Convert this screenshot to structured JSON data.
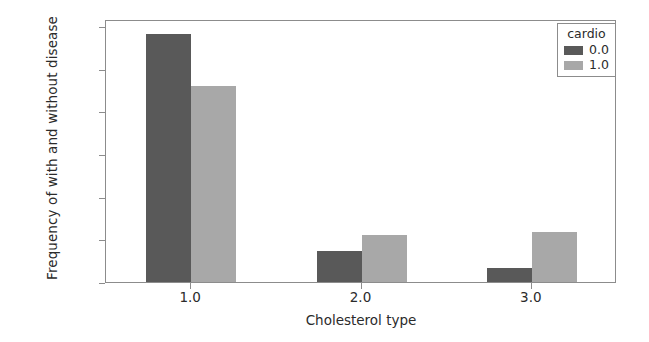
{
  "chart_data": {
    "type": "bar",
    "title": "",
    "subtitle": "",
    "xlabel": "Cholesterol type",
    "ylabel": "Frequency of with and without disease",
    "categories": [
      "1.0",
      "2.0",
      "3.0"
    ],
    "series": [
      {
        "name": "0.0",
        "color": "#595959",
        "values": [
          29100,
          3600,
          1600
        ]
      },
      {
        "name": "1.0",
        "color": "#a8a8a8",
        "values": [
          23000,
          5550,
          5850
        ]
      }
    ],
    "ylim": [
      0,
      30800
    ],
    "yticks": [
      0,
      5000,
      10000,
      15000,
      20000,
      25000,
      30000
    ],
    "ytick_labels": [
      "0",
      "5000",
      "10000",
      "15000",
      "20000",
      "25000",
      "30000"
    ],
    "xtick_labels": [
      "1.0",
      "2.0",
      "3.0"
    ],
    "grid": false,
    "legend": {
      "title": "cardio",
      "position": "upper right",
      "entries": [
        {
          "label": "0.0",
          "color": "#595959"
        },
        {
          "label": "1.0",
          "color": "#a8a8a8"
        }
      ]
    },
    "axis_color": "#8c8c8c",
    "background": "#ffffff"
  }
}
